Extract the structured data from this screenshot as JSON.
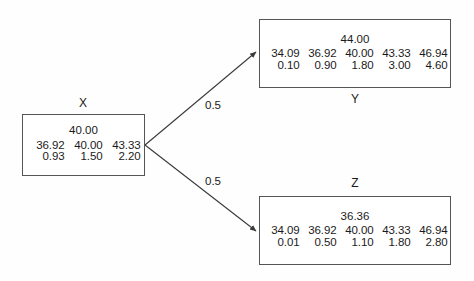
{
  "diagram": {
    "type": "probability-tree",
    "background_color": "#fefefe",
    "line_color": "#555555",
    "text_color": "#1a1a1a",
    "nodes": [
      {
        "id": "x",
        "label": "X",
        "label_position": "above",
        "header": "40.00",
        "columns": [
          "36.92",
          "40.00",
          "43.33"
        ],
        "values": [
          "0.93",
          "1.50",
          "2.20"
        ]
      },
      {
        "id": "y",
        "label": "Y",
        "label_position": "below",
        "header": "44.00",
        "columns": [
          "34.09",
          "36.92",
          "40.00",
          "43.33",
          "46.94"
        ],
        "values": [
          "0.10",
          "0.90",
          "1.80",
          "3.00",
          "4.60"
        ]
      },
      {
        "id": "z",
        "label": "Z",
        "label_position": "above",
        "header": "36.36",
        "columns": [
          "34.09",
          "36.92",
          "40.00",
          "43.33",
          "46.94"
        ],
        "values": [
          "0.01",
          "0.50",
          "1.10",
          "1.80",
          "2.80"
        ]
      }
    ],
    "edges": [
      {
        "id": "x-to-y",
        "from": "x",
        "to": "y",
        "label": "0.5"
      },
      {
        "id": "x-to-z",
        "from": "x",
        "to": "z",
        "label": "0.5"
      }
    ]
  }
}
